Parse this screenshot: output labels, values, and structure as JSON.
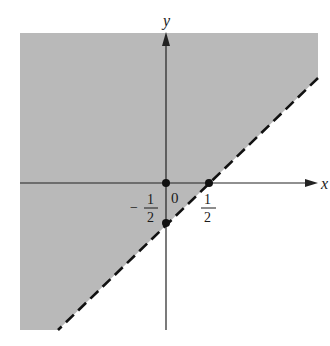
{
  "diagram": {
    "type": "half-plane inequality graph",
    "colors": {
      "shade": "#b9b9b9",
      "axis": "#222222",
      "boundary": "#111111",
      "point": "#111111",
      "background": "#ffffff"
    },
    "axes": {
      "x_label": "x",
      "y_label": "y",
      "origin_label": "0"
    },
    "boundary_line": {
      "style": "dashed",
      "description": "y = x - 1/2"
    },
    "points": [
      {
        "name": "origin",
        "x": 0,
        "y": 0
      },
      {
        "name": "x-intercept",
        "x": 0.5,
        "y": 0
      },
      {
        "name": "y-intercept",
        "x": 0,
        "y": -0.5
      }
    ],
    "tick_labels": {
      "x_half": {
        "numerator": "1",
        "denominator": "2"
      },
      "y_neg_half": {
        "sign": "−",
        "numerator": "1",
        "denominator": "2"
      }
    },
    "shaded_region": "above the line (y > x - 1/2)"
  }
}
